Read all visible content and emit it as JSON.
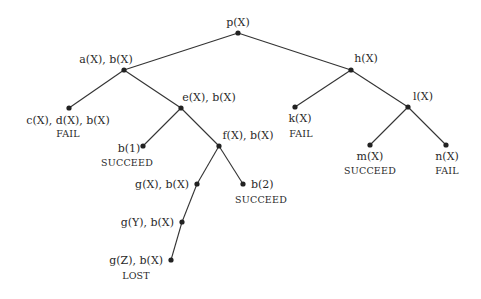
{
  "diagram": {
    "type": "search-tree",
    "nodes": [
      {
        "id": "p",
        "label": "p(X)",
        "status": ""
      },
      {
        "id": "a",
        "label": "a(X), b(X)",
        "status": ""
      },
      {
        "id": "c",
        "label": "c(X), d(X), b(X)",
        "status": "FAIL"
      },
      {
        "id": "e",
        "label": "e(X), b(X)",
        "status": ""
      },
      {
        "id": "b1",
        "label": "b(1)",
        "status": "SUCCEED"
      },
      {
        "id": "f",
        "label": "f(X), b(X)",
        "status": ""
      },
      {
        "id": "gX",
        "label": "g(X), b(X)",
        "status": ""
      },
      {
        "id": "b2",
        "label": "b(2)",
        "status": "SUCCEED"
      },
      {
        "id": "gY",
        "label": "g(Y), b(X)",
        "status": ""
      },
      {
        "id": "gZ",
        "label": "g(Z), b(X)",
        "status": "LOST"
      },
      {
        "id": "h",
        "label": "h(X)",
        "status": ""
      },
      {
        "id": "k",
        "label": "k(X)",
        "status": "FAIL"
      },
      {
        "id": "l",
        "label": "l(X)",
        "status": ""
      },
      {
        "id": "m",
        "label": "m(X)",
        "status": "SUCCEED"
      },
      {
        "id": "n",
        "label": "n(X)",
        "status": "FAIL"
      }
    ],
    "edges": [
      [
        "p",
        "a"
      ],
      [
        "p",
        "h"
      ],
      [
        "a",
        "c"
      ],
      [
        "a",
        "e"
      ],
      [
        "e",
        "b1"
      ],
      [
        "e",
        "f"
      ],
      [
        "f",
        "gX"
      ],
      [
        "f",
        "b2"
      ],
      [
        "gX",
        "gY"
      ],
      [
        "gY",
        "gZ"
      ],
      [
        "h",
        "k"
      ],
      [
        "h",
        "l"
      ],
      [
        "l",
        "m"
      ],
      [
        "l",
        "n"
      ]
    ]
  }
}
